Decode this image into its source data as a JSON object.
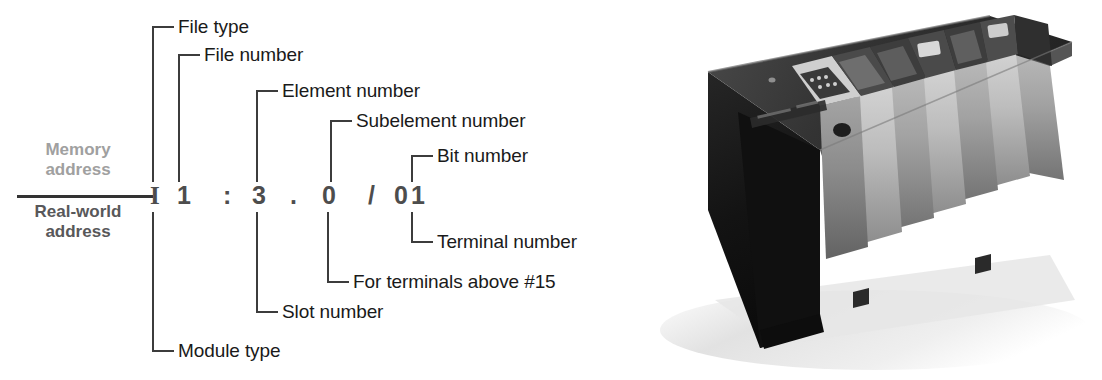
{
  "figure": {
    "kind": "plc-address-breakdown-diagram",
    "background": "#ffffff"
  },
  "address": {
    "full_text": "I 1 : 3 . 0 / 01",
    "characters": [
      {
        "id": "file-type-char",
        "text": "I",
        "x": 150
      },
      {
        "id": "file-number-char",
        "text": "1",
        "x": 177
      },
      {
        "id": "colon-separator",
        "text": ":",
        "x": 223
      },
      {
        "id": "element-number-char",
        "text": "3",
        "x": 252
      },
      {
        "id": "dot-separator",
        "text": ".",
        "x": 290
      },
      {
        "id": "subelement-number-char",
        "text": "0",
        "x": 322
      },
      {
        "id": "slash-separator",
        "text": "/",
        "x": 368
      },
      {
        "id": "bit-number-char",
        "text": "0",
        "x": 394
      },
      {
        "id": "terminal-number-char",
        "text": "1",
        "x": 411
      }
    ]
  },
  "address_kind": {
    "memory_line1": "Memory",
    "memory_line2": "address",
    "real_line1": "Real-world",
    "real_line2": "address",
    "memory_color": "#a0a0a0",
    "real_color": "#58585a"
  },
  "callouts_above": [
    {
      "id": "file-type",
      "label": "File type",
      "stem_x": 152,
      "stem_top": 26,
      "stem_bottom": 182,
      "arm_x": 152,
      "arm_w": 22,
      "arm_y": 26,
      "text_x": 178,
      "text_y": 16
    },
    {
      "id": "file-number",
      "label": "File number",
      "stem_x": 178,
      "stem_top": 54,
      "stem_bottom": 182,
      "arm_x": 178,
      "arm_w": 22,
      "arm_y": 54,
      "text_x": 204,
      "text_y": 44
    },
    {
      "id": "element-number",
      "label": "Element number",
      "stem_x": 256,
      "stem_top": 90,
      "stem_bottom": 182,
      "arm_x": 256,
      "arm_w": 22,
      "arm_y": 90,
      "text_x": 282,
      "text_y": 80
    },
    {
      "id": "subelement-number",
      "label": "Subelement number",
      "stem_x": 330,
      "stem_top": 120,
      "stem_bottom": 182,
      "arm_x": 330,
      "arm_w": 22,
      "arm_y": 120,
      "text_x": 356,
      "text_y": 110
    },
    {
      "id": "bit-number",
      "label": "Bit number",
      "stem_x": 411,
      "stem_top": 155,
      "stem_bottom": 182,
      "arm_x": 411,
      "arm_w": 22,
      "arm_y": 155,
      "text_x": 437,
      "text_y": 145
    }
  ],
  "callouts_below": [
    {
      "id": "terminal-number",
      "label": "Terminal number",
      "stem_x": 411,
      "stem_top": 212,
      "stem_bottom": 243,
      "arm_x": 411,
      "arm_w": 22,
      "arm_y": 241,
      "text_x": 437,
      "text_y": 231
    },
    {
      "id": "for-terminals-above-15",
      "label": "For terminals above #15",
      "stem_x": 327,
      "stem_top": 212,
      "stem_bottom": 283,
      "arm_x": 327,
      "arm_w": 22,
      "arm_y": 281,
      "text_x": 353,
      "text_y": 271
    },
    {
      "id": "slot-number",
      "label": "Slot number",
      "stem_x": 256,
      "stem_top": 212,
      "stem_bottom": 313,
      "arm_x": 256,
      "arm_w": 22,
      "arm_y": 311,
      "text_x": 282,
      "text_y": 301
    },
    {
      "id": "module-type",
      "label": "Module type",
      "stem_x": 152,
      "stem_top": 212,
      "stem_bottom": 352,
      "arm_x": 152,
      "arm_w": 22,
      "arm_y": 350,
      "text_x": 178,
      "text_y": 340
    }
  ],
  "photo": {
    "alt_name": "plc-chassis-photo",
    "description": "Modular PLC chassis with power supply, processor module and I/O modules",
    "module_count": 8,
    "colors": {
      "body_dark": "#1b1b1b",
      "front_mid": "#6e6e6e",
      "module_light": "#b9b9b9",
      "module_mid": "#8e8e8e",
      "top_dark": "#2e2e2e",
      "shadow": "#d8d8d8"
    }
  }
}
